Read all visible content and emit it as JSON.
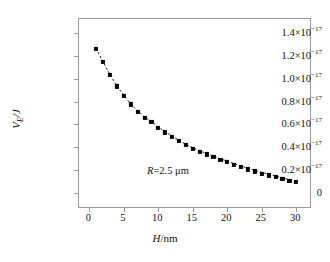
{
  "chart_data": {
    "type": "scatter",
    "title": "",
    "xlabel": "H/nm",
    "ylabel": "V_E/J",
    "xlabel_parts": {
      "symbol": "H",
      "unit": "/nm"
    },
    "ylabel_parts": {
      "symbol": "V",
      "subscript": "E",
      "unit": "/J"
    },
    "xlim": [
      -1.5,
      32
    ],
    "ylim": [
      -0.12,
      1.52
    ],
    "y_scale_factor": "1e-17",
    "grid": false,
    "legend": "none",
    "marker_style": "filled-square",
    "line_style": "dashed",
    "line_color": "#000000",
    "marker_color": "#000000",
    "xticks": [
      0,
      5,
      10,
      15,
      20,
      25,
      30
    ],
    "xtick_labels": [
      "0",
      "5",
      "10",
      "15",
      "20",
      "25",
      "30"
    ],
    "yticks": [
      0,
      0.2,
      0.4,
      0.6,
      0.8,
      1.0,
      1.2,
      1.4
    ],
    "ytick_labels": [
      {
        "mantissa": "0",
        "exponent": ""
      },
      {
        "mantissa": "0.2×10",
        "exponent": "−17"
      },
      {
        "mantissa": "0.4×10",
        "exponent": "−17"
      },
      {
        "mantissa": "0.6×10",
        "exponent": "−17"
      },
      {
        "mantissa": "0.8×10",
        "exponent": "−17"
      },
      {
        "mantissa": "1.0×10",
        "exponent": "−17"
      },
      {
        "mantissa": "1.2×10",
        "exponent": "−17"
      },
      {
        "mantissa": "1.4×10",
        "exponent": "−17"
      }
    ],
    "annotations": [
      {
        "name": "radius-annotation",
        "symbol": "R",
        "text": "=2.5 μm",
        "x": 8.5,
        "y": 0.175
      }
    ],
    "x": [
      1,
      2,
      3,
      4,
      5,
      6,
      7,
      8,
      9,
      10,
      11,
      12,
      13,
      14,
      15,
      16,
      17,
      18,
      19,
      20,
      21,
      22,
      23,
      24,
      25,
      26,
      27,
      28,
      29,
      30
    ],
    "y": [
      1.262,
      1.145,
      1.035,
      0.932,
      0.852,
      0.775,
      0.712,
      0.66,
      0.62,
      0.572,
      0.53,
      0.492,
      0.455,
      0.42,
      0.39,
      0.362,
      0.338,
      0.315,
      0.292,
      0.27,
      0.248,
      0.228,
      0.208,
      0.19,
      0.172,
      0.155,
      0.14,
      0.125,
      0.108,
      0.096
    ],
    "values_unit": "1e-17 J",
    "n_points": 30
  }
}
